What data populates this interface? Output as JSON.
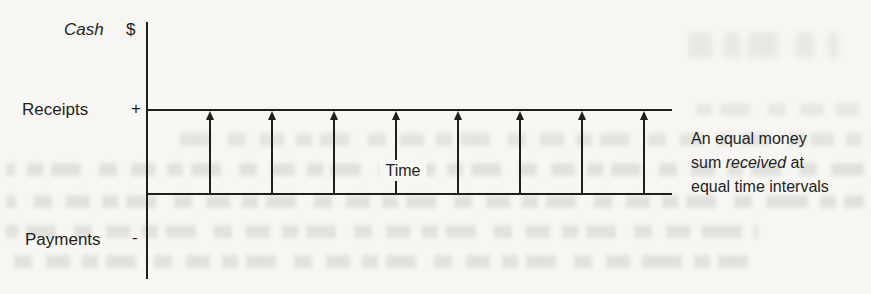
{
  "diagram": {
    "labels": {
      "cash": "Cash",
      "dollar": "$",
      "receipts": "Receipts",
      "plus": "+",
      "payments": "Payments",
      "minus": "-",
      "time": "Time"
    },
    "arrows": {
      "count": 8,
      "direction": "up"
    }
  },
  "caption": {
    "line1": "An equal money",
    "line2_pre": "sum ",
    "line2_italic": "received",
    "line2_post": " at",
    "line3": "equal time intervals"
  },
  "colors": {
    "ink": "#1f1f1f",
    "paper": "#f7f6f2"
  }
}
